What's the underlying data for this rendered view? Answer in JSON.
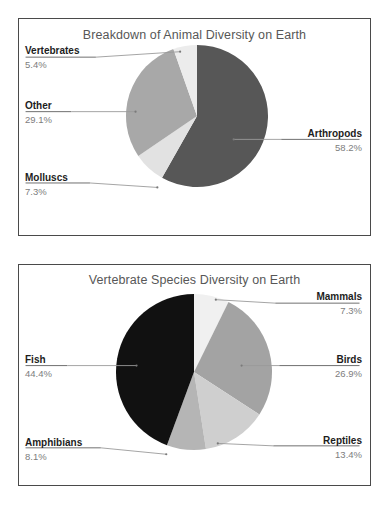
{
  "document": {
    "background_color": "#ffffff",
    "panel_border_color": "#4a4a4a"
  },
  "charts": [
    {
      "id": "animal-diversity",
      "title": "Breakdown of Animal Diversity on Earth",
      "labels": {
        "vertebrates_name": "Vertebrates",
        "vertebrates_pct": "5.4%",
        "other_name": "Other",
        "other_pct": "29.1%",
        "molluscs_name": "Molluscs",
        "molluscs_pct": "7.3%",
        "arthropods_name": "Arthropods",
        "arthropods_pct": "58.2%"
      }
    },
    {
      "id": "vertebrate-diversity",
      "title": "Vertebrate Species Diversity on Earth",
      "labels": {
        "mammals_name": "Mammals",
        "mammals_pct": "7.3%",
        "birds_name": "Birds",
        "birds_pct": "26.9%",
        "reptiles_name": "Reptiles",
        "reptiles_pct": "13.4%",
        "amphibians_name": "Amphibians",
        "amphibians_pct": "8.1%",
        "fish_name": "Fish",
        "fish_pct": "44.4%"
      }
    }
  ],
  "chart_data": [
    {
      "type": "pie",
      "title": "Breakdown of Animal Diversity on Earth",
      "xlabel": "",
      "ylabel": "",
      "start_angle": 90,
      "direction": "clockwise",
      "legend": "none",
      "labels_style": "leader-line callouts",
      "categories": [
        "Arthropods",
        "Molluscs",
        "Other",
        "Vertebrates"
      ],
      "values": [
        58.2,
        7.3,
        29.1,
        5.4
      ],
      "value_labels": [
        "58.2%",
        "7.3%",
        "29.1%",
        "5.4%"
      ],
      "unit": "percent",
      "colors": [
        "#575757",
        "#e2e2e2",
        "#a8a8a8",
        "#ececec"
      ],
      "slices": [
        {
          "name": "Arthropods",
          "value": 58.2,
          "label": "58.2%",
          "color": "#575757"
        },
        {
          "name": "Molluscs",
          "value": 7.3,
          "label": "7.3%",
          "color": "#e2e2e2"
        },
        {
          "name": "Other",
          "value": 29.1,
          "label": "29.1%",
          "color": "#a8a8a8"
        },
        {
          "name": "Vertebrates",
          "value": 5.4,
          "label": "5.4%",
          "color": "#ececec"
        }
      ]
    },
    {
      "type": "pie",
      "title": "Vertebrate Species Diversity on Earth",
      "xlabel": "",
      "ylabel": "",
      "start_angle": 90,
      "direction": "clockwise",
      "legend": "none",
      "labels_style": "leader-line callouts",
      "categories": [
        "Mammals",
        "Birds",
        "Reptiles",
        "Amphibians",
        "Fish"
      ],
      "values": [
        7.3,
        26.9,
        13.4,
        8.1,
        44.4
      ],
      "value_labels": [
        "7.3%",
        "26.9%",
        "13.4%",
        "8.1%",
        "44.4%"
      ],
      "unit": "percent",
      "colors": [
        "#f0f0f0",
        "#a3a3a3",
        "#cfcfcf",
        "#b5b5b5",
        "#111111"
      ],
      "slices": [
        {
          "name": "Mammals",
          "value": 7.3,
          "label": "7.3%",
          "color": "#f0f0f0"
        },
        {
          "name": "Birds",
          "value": 26.9,
          "label": "26.9%",
          "color": "#a3a3a3"
        },
        {
          "name": "Reptiles",
          "value": 13.4,
          "label": "13.4%",
          "color": "#cfcfcf"
        },
        {
          "name": "Amphibians",
          "value": 8.1,
          "label": "8.1%",
          "color": "#b5b5b5"
        },
        {
          "name": "Fish",
          "value": 44.4,
          "label": "44.4%",
          "color": "#111111"
        }
      ]
    }
  ]
}
